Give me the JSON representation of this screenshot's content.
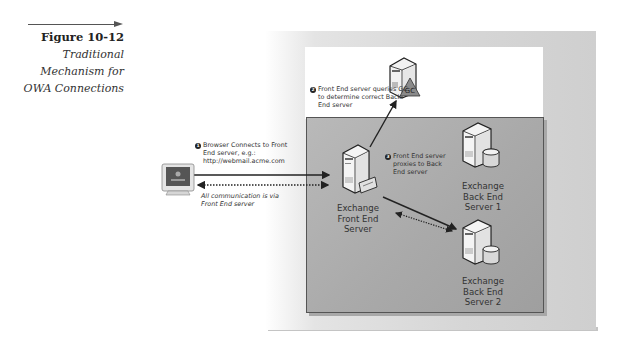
{
  "caption": {
    "title": "Figure 10-12",
    "subtitle_lines": [
      "Traditional",
      "Mechanism for",
      "OWA Connections"
    ]
  },
  "notes": {
    "step1": {
      "number": "1",
      "lines": [
        "Browser Connects to Front",
        "End server, e.g.:",
        "http://webmail.acme.com"
      ]
    },
    "step2": {
      "number": "2",
      "lines": [
        "Front End server queries GC",
        "to determine correct Back",
        "End server"
      ]
    },
    "step3": {
      "number": "3",
      "lines": [
        "Front End server",
        "proxies to Back",
        "End server"
      ]
    },
    "all_comm": {
      "lines": [
        "All communication is via",
        "Front End server"
      ]
    }
  },
  "nodes": {
    "client": {
      "icon": "monitor-icon",
      "label": ""
    },
    "gc": {
      "icon": "server-gc-icon",
      "badge": "GC"
    },
    "front_end": {
      "icon": "server-icon",
      "lines": [
        "Exchange",
        "Front End",
        "Server"
      ]
    },
    "back_end_1": {
      "icon": "server-database-icon",
      "lines": [
        "Exchange",
        "Back End",
        "Server 1"
      ]
    },
    "back_end_2": {
      "icon": "server-database-icon",
      "lines": [
        "Exchange",
        "Back End",
        "Server 2"
      ]
    }
  },
  "colors": {
    "panel_gray": "#a9a9a9",
    "outer_gray": "#d6d6d6",
    "line": "#222222",
    "text": "#333333"
  }
}
